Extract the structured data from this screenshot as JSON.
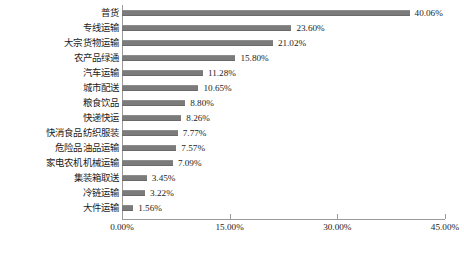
{
  "chart_data": {
    "type": "bar",
    "orientation": "horizontal",
    "title": "",
    "xlabel": "",
    "ylabel": "",
    "xlim": [
      0,
      45
    ],
    "xticks": [
      "0.00%",
      "15.00%",
      "30.00%",
      "45.00%"
    ],
    "xtick_values": [
      0,
      15,
      30,
      45
    ],
    "grid": false,
    "legend": null,
    "bar_color": "#7b7b7b",
    "axis_color": "#9a9a9a",
    "categories": [
      "普货",
      "专线运输",
      "大宗货物运输",
      "农产品绿通",
      "汽车运输",
      "城市配送",
      "粮食饮品",
      "快递快运",
      "快消食品纺织服装",
      "危险品油品运输",
      "家电农机机械运输",
      "集装箱取送",
      "冷链运输",
      "大件运输"
    ],
    "values": [
      40.06,
      23.6,
      21.02,
      15.8,
      11.28,
      10.65,
      8.8,
      8.26,
      7.77,
      7.57,
      7.09,
      3.45,
      3.22,
      1.56
    ],
    "value_labels": [
      "40.06%",
      "23.60%",
      "21.02%",
      "15.80%",
      "11.28%",
      "10.65%",
      "8.80%",
      "8.26%",
      "7.77%",
      "7.57%",
      "7.09%",
      "3.45%",
      "3.22%",
      "1.56%"
    ]
  },
  "caption": {
    "text": ""
  }
}
